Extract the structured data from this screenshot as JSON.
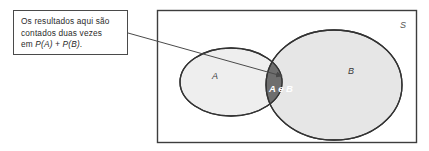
{
  "figure": {
    "type": "venn-diagram",
    "background_color": "#ffffff",
    "width": 429,
    "height": 151
  },
  "callout": {
    "line1": "Os resultados aqui são",
    "line2": "contados duas vezes",
    "line3_prefix": "em ",
    "line3_math": "P(A) + P(B)",
    "line3_suffix": ".",
    "border_color": "#4a4a4a",
    "background_color": "#ffffff",
    "text_color": "#2b2b2b"
  },
  "venn": {
    "universe_label": "S",
    "universe_border_color": "#3d3d3d",
    "set_a": {
      "label": "A",
      "fill_color": "#eeeeee",
      "stroke_color": "#333333"
    },
    "set_b": {
      "label": "B",
      "fill_color": "#e6e6e6",
      "stroke_color": "#333333"
    },
    "intersection": {
      "label": "A e B",
      "fill_color": "#6e6e6e",
      "stroke_color": "#333333",
      "text_color": "#ffffff"
    },
    "pointer": {
      "stroke_color": "#4a4a4a",
      "arrow_target": "intersection"
    }
  }
}
